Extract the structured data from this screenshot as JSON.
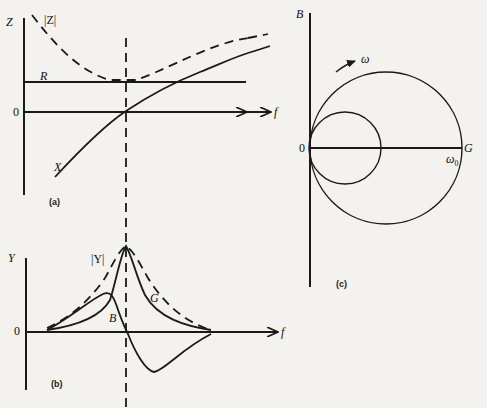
{
  "figure": {
    "panel_a": {
      "caption": "(a)",
      "y_axis_label": "Z",
      "x_axis_label": "f",
      "origin_label": "0",
      "curves": {
        "magnitude": "|Z|",
        "resistance": "R",
        "reactance": "X"
      }
    },
    "panel_b": {
      "caption": "(b)",
      "y_axis_label": "Y",
      "x_axis_label": "f",
      "origin_label": "0",
      "curves": {
        "magnitude": "|Y|",
        "conductance": "G",
        "susceptance": "B"
      }
    },
    "panel_c": {
      "caption": "(c)",
      "y_axis_label": "B",
      "x_axis_label": "G",
      "origin_label": "0",
      "frequency_label": "ω",
      "resonance_label": "ω₀",
      "resonance_subscript_base": "ω",
      "resonance_subscript": "0"
    }
  },
  "colors": {
    "ink": "#1a1a1a",
    "paper": "#f3f2ee"
  }
}
